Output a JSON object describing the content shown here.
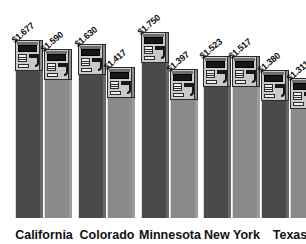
{
  "chart_data": {
    "type": "bar",
    "title": "",
    "subtitle": "",
    "xlabel": "",
    "ylabel": "",
    "grid": false,
    "legend": "none",
    "pictogram": "gas-pump",
    "value_prefix": "$",
    "ylim": [
      0,
      1.75
    ],
    "categories": [
      "California",
      "Colorado",
      "Minnesota",
      "New York",
      "Texas"
    ],
    "series": [
      {
        "name": "bar-1",
        "values": [
          1.677,
          1.63,
          1.75,
          1.523,
          1.38
        ],
        "color": "#4a4a4a"
      },
      {
        "name": "bar-2",
        "values": [
          1.59,
          1.417,
          1.397,
          1.517,
          1.311
        ],
        "color": "#8a8a8a"
      }
    ],
    "bars": [
      {
        "group": "California",
        "index": 0,
        "label": "$1.677",
        "value": 1.677,
        "color": "#4a4a4a"
      },
      {
        "group": "California",
        "index": 1,
        "label": "$1.590",
        "value": 1.59,
        "color": "#8a8a8a"
      },
      {
        "group": "Colorado",
        "index": 0,
        "label": "$1.630",
        "value": 1.63,
        "color": "#4a4a4a"
      },
      {
        "group": "Colorado",
        "index": 1,
        "label": "$1.417",
        "value": 1.417,
        "color": "#8a8a8a"
      },
      {
        "group": "Minnesota",
        "index": 0,
        "label": "$1.750",
        "value": 1.75,
        "color": "#4a4a4a"
      },
      {
        "group": "Minnesota",
        "index": 1,
        "label": "$1.397",
        "value": 1.397,
        "color": "#8a8a8a"
      },
      {
        "group": "New York",
        "index": 0,
        "label": "$1.523",
        "value": 1.523,
        "color": "#4a4a4a"
      },
      {
        "group": "New York",
        "index": 1,
        "label": "$1.517",
        "value": 1.517,
        "color": "#8a8a8a"
      },
      {
        "group": "Texas",
        "index": 0,
        "label": "$1.380",
        "value": 1.38,
        "color": "#4a4a4a"
      },
      {
        "group": "Texas",
        "index": 1,
        "label": "$1.311",
        "value": 1.311,
        "color": "#8a8a8a"
      }
    ]
  },
  "layout": {
    "bar_width": 28,
    "baseline_y": 218,
    "bar_left_positions": [
      15,
      44,
      78,
      107,
      141,
      170,
      203,
      232,
      261,
      290
    ],
    "category_center_x": [
      44,
      107,
      170,
      232,
      290
    ],
    "min_body_px": 8,
    "scale_px_per_unit": 104,
    "value_zero_px": 4
  }
}
